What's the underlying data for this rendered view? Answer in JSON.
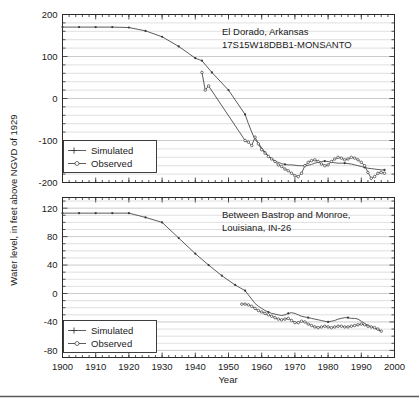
{
  "figure": {
    "ylabel": "Water level, in feet above NGVD of 1929",
    "xlabel": "Year"
  },
  "chart_data": [
    {
      "type": "line",
      "panel": "top",
      "title": "",
      "annotation_lines": [
        "El Dorado, Arkansas",
        "17S15W18DBB1-MONSANTO"
      ],
      "xlabel": "",
      "ylabel": "Water level, in feet above NGVD of 1929",
      "xlim": [
        1900,
        2000
      ],
      "ylim": [
        -200,
        200
      ],
      "xticks": [
        1900,
        1910,
        1920,
        1930,
        1940,
        1950,
        1960,
        1970,
        1980,
        1990,
        2000
      ],
      "yticks": [
        -200,
        -100,
        0,
        100,
        200
      ],
      "yminor_step": 20,
      "grid": true,
      "legend_position": "lower-left",
      "series": [
        {
          "name": "Simulated",
          "marker": "plus",
          "x": [
            1900,
            1905,
            1910,
            1915,
            1920,
            1925,
            1930,
            1935,
            1940,
            1942,
            1945,
            1950,
            1955,
            1956,
            1957,
            1958,
            1959,
            1960,
            1961,
            1962,
            1963,
            1964,
            1965,
            1966,
            1967,
            1968,
            1969,
            1970,
            1971,
            1972,
            1973,
            1974,
            1975,
            1976,
            1977,
            1978,
            1979,
            1980,
            1981,
            1982,
            1983,
            1984,
            1985,
            1986,
            1987,
            1988,
            1989,
            1990,
            1991,
            1992,
            1993,
            1994,
            1995,
            1996,
            1997
          ],
          "values": [
            170,
            170,
            170,
            170,
            169,
            161,
            147,
            124,
            96,
            90,
            62,
            20,
            -38,
            -60,
            -80,
            -98,
            -106,
            -118,
            -128,
            -136,
            -143,
            -149,
            -152,
            -155,
            -157,
            -158,
            -158,
            -159,
            -160,
            -160,
            -160,
            -159,
            -157,
            -154,
            -152,
            -150,
            -149,
            -150,
            -152,
            -153,
            -154,
            -154,
            -154,
            -155,
            -156,
            -158,
            -160,
            -162,
            -164,
            -166,
            -167,
            -168,
            -169,
            -170,
            -170
          ]
        },
        {
          "name": "Observed",
          "marker": "circle",
          "x": [
            1942,
            1943,
            1944,
            1955,
            1956,
            1957,
            1958,
            1959,
            1960,
            1961,
            1962,
            1963,
            1964,
            1965,
            1966,
            1967,
            1968,
            1969,
            1970,
            1971,
            1972,
            1973,
            1974,
            1975,
            1976,
            1977,
            1978,
            1979,
            1980,
            1981,
            1982,
            1983,
            1984,
            1985,
            1986,
            1987,
            1988,
            1989,
            1990,
            1991,
            1992,
            1993,
            1994,
            1995,
            1996,
            1997
          ],
          "values": [
            62,
            20,
            30,
            -100,
            -104,
            -112,
            -92,
            -108,
            -122,
            -130,
            -138,
            -144,
            -150,
            -158,
            -162,
            -168,
            -172,
            -178,
            -184,
            -186,
            -178,
            -160,
            -152,
            -148,
            -146,
            -150,
            -156,
            -160,
            -158,
            -150,
            -144,
            -140,
            -142,
            -146,
            -144,
            -140,
            -142,
            -146,
            -152,
            -160,
            -176,
            -190,
            -186,
            -178,
            -176,
            -178
          ]
        }
      ]
    },
    {
      "type": "line",
      "panel": "bottom",
      "title": "",
      "annotation_lines": [
        "Between Bastrop and Monroe,",
        "Louisiana, IN-26"
      ],
      "xlabel": "Year",
      "ylabel": "Water level, in feet above NGVD of 1929",
      "xlim": [
        1900,
        2000
      ],
      "ylim": [
        -90,
        135
      ],
      "xticks": [
        1900,
        1910,
        1920,
        1930,
        1940,
        1950,
        1960,
        1970,
        1980,
        1990,
        2000
      ],
      "yticks": [
        -80,
        -40,
        0,
        40,
        80,
        120
      ],
      "yminor_step": 10,
      "grid": true,
      "legend_position": "lower-left",
      "series": [
        {
          "name": "Simulated",
          "marker": "plus",
          "x": [
            1900,
            1905,
            1910,
            1915,
            1920,
            1925,
            1930,
            1935,
            1940,
            1944,
            1948,
            1952,
            1955,
            1957,
            1958,
            1959,
            1960,
            1961,
            1962,
            1963,
            1964,
            1965,
            1966,
            1967,
            1968,
            1969,
            1970,
            1971,
            1972,
            1973,
            1974,
            1975,
            1976,
            1977,
            1978,
            1979,
            1980,
            1981,
            1982,
            1983,
            1984,
            1985,
            1986,
            1987,
            1988,
            1989,
            1990,
            1991,
            1992,
            1993,
            1994,
            1995,
            1996
          ],
          "values": [
            113,
            113,
            113,
            113,
            113,
            107,
            100,
            78,
            56,
            40,
            25,
            12,
            4,
            -8,
            -14,
            -18,
            -21,
            -24,
            -26,
            -28,
            -29,
            -30,
            -31,
            -30,
            -28,
            -27,
            -28,
            -30,
            -32,
            -33,
            -34,
            -35,
            -36,
            -37,
            -38,
            -39,
            -40,
            -39,
            -38,
            -36,
            -35,
            -34,
            -34,
            -35,
            -35,
            -36,
            -39,
            -42,
            -45,
            -47,
            -49,
            -51,
            -53
          ]
        },
        {
          "name": "Observed",
          "marker": "circle",
          "x": [
            1954,
            1955,
            1956,
            1957,
            1958,
            1959,
            1960,
            1961,
            1962,
            1963,
            1964,
            1965,
            1966,
            1967,
            1968,
            1969,
            1970,
            1971,
            1972,
            1973,
            1974,
            1975,
            1976,
            1977,
            1978,
            1979,
            1980,
            1981,
            1982,
            1983,
            1984,
            1985,
            1986,
            1987,
            1988,
            1989,
            1990,
            1991,
            1992,
            1993,
            1994,
            1995,
            1996
          ],
          "values": [
            -15,
            -15,
            -16,
            -18,
            -21,
            -24,
            -26,
            -28,
            -30,
            -32,
            -34,
            -36,
            -37,
            -36,
            -35,
            -38,
            -41,
            -41,
            -39,
            -40,
            -43,
            -45,
            -47,
            -48,
            -47,
            -46,
            -47,
            -48,
            -47,
            -46,
            -46,
            -47,
            -47,
            -46,
            -45,
            -44,
            -43,
            -44,
            -46,
            -47,
            -48,
            -50,
            -53
          ]
        }
      ]
    }
  ],
  "legend": {
    "items": [
      {
        "label": "Simulated",
        "marker": "plus"
      },
      {
        "label": "Observed",
        "marker": "circle"
      }
    ]
  }
}
